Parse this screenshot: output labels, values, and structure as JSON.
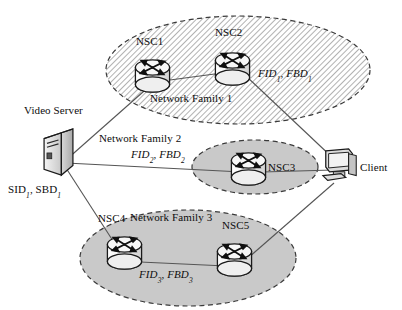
{
  "diagram": {
    "colors": {
      "stroke": "#1a1a1a",
      "hatch_fill": "#ffffff",
      "hatch_line": "#9a9a9a",
      "solid_fill": "#c9c9c9",
      "link": "#4a4a4a",
      "device_fill": "#e8e8e8",
      "text": "#0d0d0d"
    },
    "families": [
      {
        "id": "network-family-1",
        "label": "Network Family 1",
        "metric_label": "FID",
        "metric_label_2": "FBD",
        "subscript": "1",
        "fill_style": "hatched",
        "cx": 238,
        "cy": 70,
        "rx": 132,
        "ry": 54
      },
      {
        "id": "network-family-2",
        "label": "Network Family 2",
        "metric_label": "FID",
        "metric_label_2": "FBD",
        "subscript": "2",
        "fill_style": "solid",
        "cx": 255,
        "cy": 167,
        "rx": 63,
        "ry": 27
      },
      {
        "id": "network-family-3",
        "label": "Network Family 3",
        "metric_label": "FID",
        "metric_label_2": "FBD",
        "subscript": "3",
        "fill_style": "solid",
        "cx": 188,
        "cy": 258,
        "rx": 108,
        "ry": 48
      }
    ],
    "routers": [
      {
        "id": "nsc1",
        "label": "NSC1",
        "x": 152,
        "y": 77,
        "label_x": 137,
        "label_y": 42
      },
      {
        "id": "nsc2",
        "label": "NSC2",
        "x": 232,
        "y": 70,
        "label_x": 216,
        "label_y": 33
      },
      {
        "id": "nsc3",
        "label": "NSC3",
        "x": 248,
        "y": 169,
        "label_x": 265,
        "label_y": 160
      },
      {
        "id": "nsc4",
        "label": "NSC4",
        "x": 124,
        "y": 254,
        "label_x": 99,
        "label_y": 219
      },
      {
        "id": "nsc5",
        "label": "NSC5",
        "x": 234,
        "y": 261,
        "label_x": 222,
        "label_y": 225
      }
    ],
    "endpoints": [
      {
        "id": "video-server",
        "label": "Video Server",
        "type": "server-tower",
        "x": 60,
        "y": 155,
        "label_x": 26,
        "label_y": 110,
        "annotation": "SID, SBD",
        "annotation_subscript": "1",
        "annotation_x": 8,
        "annotation_y": 184
      },
      {
        "id": "client",
        "label": "Client",
        "type": "workstation",
        "x": 340,
        "y": 165,
        "label_x": 362,
        "label_y": 162
      }
    ],
    "links": [
      {
        "from": "video-server",
        "to": "nsc1"
      },
      {
        "from": "video-server",
        "to": "nsc3"
      },
      {
        "from": "video-server",
        "to": "nsc4"
      },
      {
        "from": "nsc1",
        "to": "nsc2"
      },
      {
        "from": "nsc2",
        "to": "client"
      },
      {
        "from": "nsc3",
        "to": "client"
      },
      {
        "from": "nsc4",
        "to": "nsc5"
      },
      {
        "from": "nsc5",
        "to": "client"
      }
    ]
  },
  "labels": {
    "family1_name": "Network Family 1",
    "family2_name": "Network Family 2",
    "family3_name": "Network Family 3",
    "nsc1": "NSC1",
    "nsc2": "NSC2",
    "nsc3": "NSC3",
    "nsc4": "NSC4",
    "nsc5": "NSC5",
    "video_server": "Video Server",
    "client": "Client"
  }
}
